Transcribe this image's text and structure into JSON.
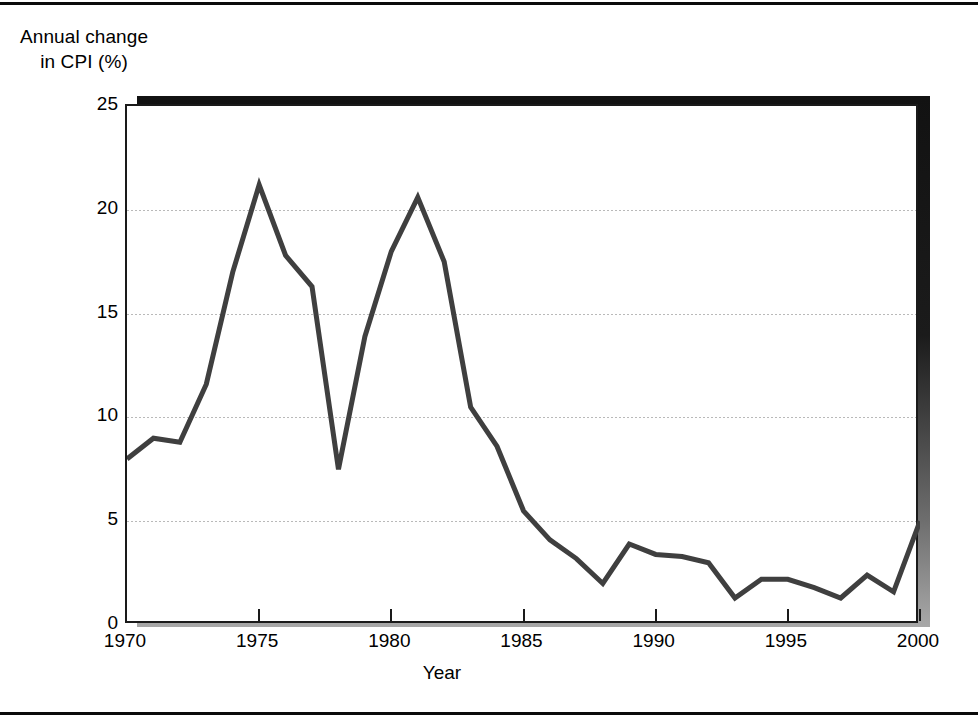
{
  "axis_caption": {
    "line1": "Annual change",
    "line2": "in CPI (%)"
  },
  "colors": {
    "line": "#3f3f3f",
    "axis": "#1a1a1a",
    "grid": "#b9b9b9",
    "shadow": "#151515",
    "background": "#ffffff"
  },
  "chart_data": {
    "type": "line",
    "title": "",
    "subtitle": "",
    "xlabel": "Year",
    "ylabel": "Annual change in CPI (%)",
    "xlim": [
      1970,
      2000
    ],
    "ylim": [
      0,
      25
    ],
    "grid": true,
    "legend": "none",
    "y_ticks": [
      0,
      5,
      10,
      15,
      20,
      25
    ],
    "y_tick_labels": [
      "0",
      "5",
      "10",
      "15",
      "20",
      "25"
    ],
    "x_ticks": [
      1970,
      1975,
      1980,
      1985,
      1990,
      1995,
      2000
    ],
    "x_tick_labels": [
      "1970",
      "1975",
      "1980",
      "1985",
      "1990",
      "1995",
      "2000"
    ],
    "series": [
      {
        "name": "Annual change in CPI (%)",
        "x": [
          1970,
          1971,
          1972,
          1973,
          1974,
          1975,
          1976,
          1977,
          1978,
          1979,
          1980,
          1981,
          1982,
          1983,
          1984,
          1985,
          1986,
          1987,
          1988,
          1989,
          1990,
          1991,
          1992,
          1993,
          1994,
          1995,
          1996,
          1997,
          1998,
          1999,
          2000
        ],
        "values": [
          8.0,
          9.0,
          8.8,
          11.6,
          17.0,
          21.2,
          17.8,
          16.3,
          7.5,
          13.9,
          18.0,
          20.6,
          17.5,
          10.5,
          8.6,
          5.5,
          4.1,
          3.2,
          2.0,
          3.9,
          3.4,
          3.3,
          3.0,
          1.3,
          2.2,
          2.2,
          1.8,
          1.3,
          2.4,
          1.6,
          5.0
        ]
      }
    ]
  }
}
